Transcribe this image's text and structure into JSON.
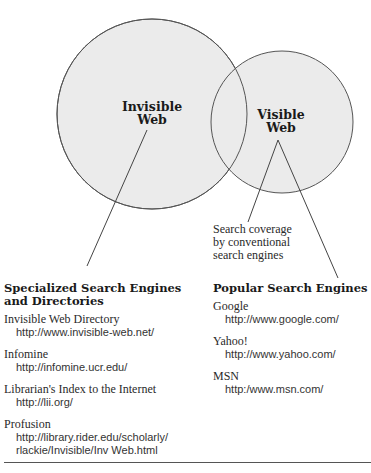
{
  "diagram": {
    "type": "venn",
    "colors": {
      "circle_fill": "#ebebeb",
      "circle_stroke": "#555555",
      "line": "#444444",
      "text": "#1a1a1a"
    },
    "circles": [
      {
        "id": "invisible",
        "label_line1": "Invisible",
        "label_line2": "Web"
      },
      {
        "id": "visible",
        "label_line1": "Visible",
        "label_line2": "Web"
      }
    ],
    "caption": {
      "line1": "Search coverage",
      "line2": "by conventional",
      "line3": "search engines"
    }
  },
  "specialized": {
    "heading_line1": "Specialized Search Engines",
    "heading_line2": "and Directories",
    "entries": [
      {
        "name": "Invisible Web Directory",
        "url": "http://www.invisible-web.net/"
      },
      {
        "name": "Infomine",
        "url": "http://infomine.ucr.edu/"
      },
      {
        "name": "Librarian's Index to the Internet",
        "url": "http://lii.org/"
      },
      {
        "name": "Profusion",
        "url": "http://library.rider.edu/scholarly/\nrlackie/Invisible/Inv Web.html"
      }
    ]
  },
  "popular": {
    "heading": "Popular Search Engines",
    "entries": [
      {
        "name": "Google",
        "url": "http://www.google.com/"
      },
      {
        "name": "Yahoo!",
        "url": "http://www.yahoo.com/"
      },
      {
        "name": "MSN",
        "url": "http:/www.msn.com/"
      }
    ]
  }
}
